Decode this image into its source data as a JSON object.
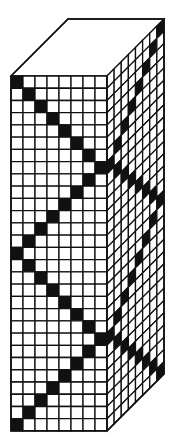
{
  "diagram": {
    "colors": {
      "background": "#ffffff",
      "line": "#111111",
      "filled": "#111111",
      "empty": "#ffffff"
    },
    "geometry": {
      "origin_x": 11,
      "origin_y": 76,
      "front_cols": 8,
      "rows": 29,
      "cell_w": 12,
      "cell_h": 12.24,
      "side_cols": 8,
      "depth_dx": 57,
      "depth_dy": -57,
      "stroke_width": 1.3
    },
    "front_face": {
      "filled_cells_rule": "zigzag column index by row, period 14, range 0-7",
      "filled_col_by_row": [
        0,
        1,
        2,
        3,
        4,
        5,
        6,
        7,
        6,
        5,
        4,
        3,
        2,
        1,
        0,
        1,
        2,
        3,
        4,
        5,
        6,
        7,
        6,
        5,
        4,
        3,
        2,
        1,
        0
      ]
    },
    "side_face": {
      "filled_cells_rule": "side column index (0 = front edge, 7 = back edge) by row",
      "filled_col_by_row": [
        7,
        6,
        5,
        4,
        3,
        2,
        1,
        0,
        1,
        2,
        3,
        4,
        5,
        6,
        7,
        6,
        5,
        4,
        3,
        2,
        1,
        0,
        1,
        2,
        3,
        4,
        5,
        6,
        7
      ]
    },
    "top_face": {
      "grid": false
    }
  }
}
